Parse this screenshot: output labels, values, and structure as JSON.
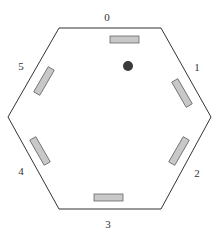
{
  "diagram": {
    "type": "hexagonal-arena",
    "side_labels": [
      "0",
      "1",
      "2",
      "3",
      "4",
      "5"
    ],
    "center_dot": {
      "color": "#3a3a3a"
    },
    "panel_color": "#c8c8c8",
    "panel_stroke": "#666666",
    "outline_color": "#333333"
  }
}
